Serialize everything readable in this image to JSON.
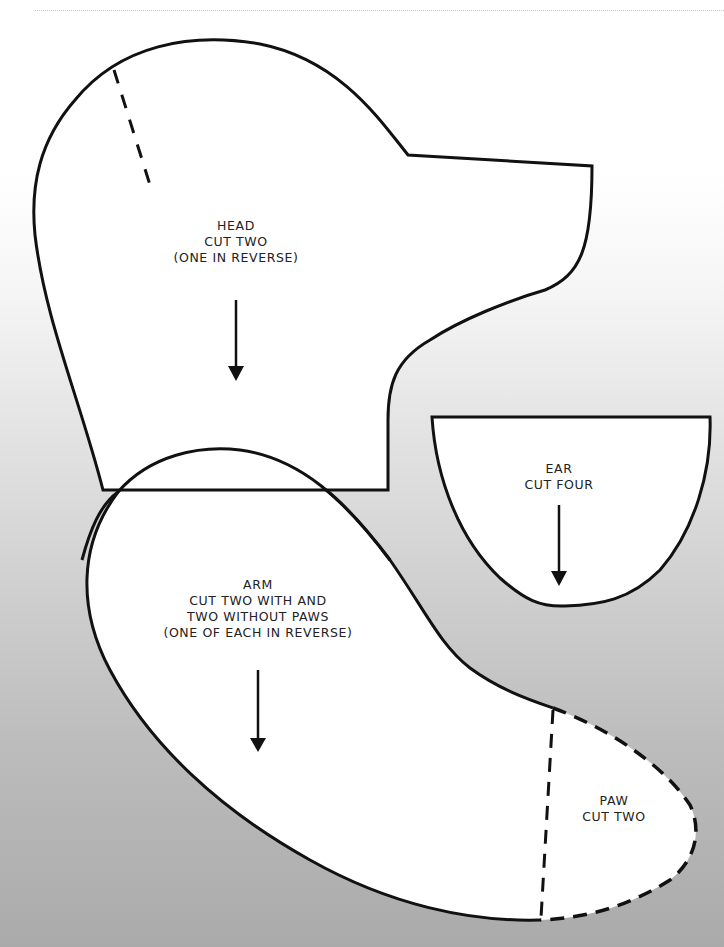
{
  "header": {
    "heading_cropped": " "
  },
  "pieces": {
    "head": {
      "name": "HEAD",
      "instructions": [
        "CUT TWO",
        "(ONE IN REVERSE)"
      ]
    },
    "ear": {
      "name": "EAR",
      "instructions": [
        "CUT FOUR"
      ]
    },
    "arm": {
      "name": "ARM",
      "instructions": [
        "CUT TWO WITH AND",
        "TWO WITHOUT PAWS",
        "(ONE OF EACH IN REVERSE)"
      ]
    },
    "paw": {
      "name": "PAW",
      "instructions": [
        "CUT TWO"
      ]
    }
  },
  "colors": {
    "outline": "#111111",
    "piece_fill": "#ffffff",
    "background_top": "#ffffff",
    "background_bottom": "#aaaaaa"
  }
}
